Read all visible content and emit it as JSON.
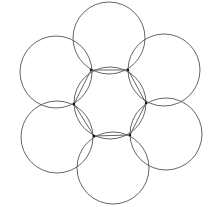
{
  "diagram": {
    "stroke_color": "#555555",
    "vertex_color": "#111111",
    "radius": 36,
    "center_circle": {
      "cx": 110,
      "cy": 103
    },
    "hexagon_vertices": [
      [
        91,
        70
      ],
      [
        128,
        70
      ],
      [
        146,
        103
      ],
      [
        130,
        135
      ],
      [
        94,
        136
      ],
      [
        74,
        104
      ]
    ],
    "outer_circles": [
      {
        "name": "top",
        "cx": 109,
        "cy": 38
      },
      {
        "name": "upper-right",
        "cx": 164,
        "cy": 70
      },
      {
        "name": "lower-right",
        "cx": 166,
        "cy": 134
      },
      {
        "name": "bottom",
        "cx": 113,
        "cy": 168
      },
      {
        "name": "lower-left",
        "cx": 57,
        "cy": 137
      },
      {
        "name": "upper-left",
        "cx": 56,
        "cy": 72
      }
    ]
  }
}
